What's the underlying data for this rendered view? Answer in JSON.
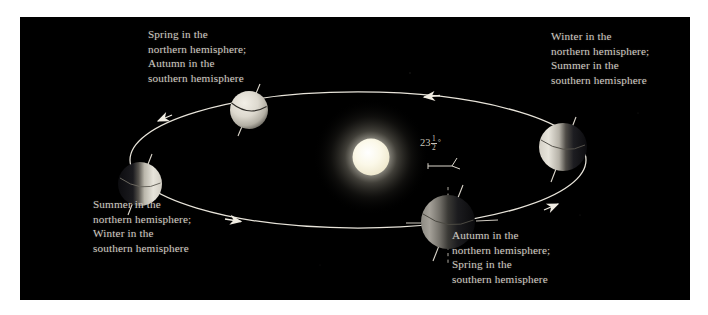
{
  "figure": {
    "background_color": "#ffffff",
    "panel_color": "#000000",
    "title": ""
  },
  "sun": {
    "name": "Sun",
    "core_color": "#fffdf2",
    "glow_color": "#c8c4b0",
    "center_x": 351,
    "center_y": 140,
    "radius": 19
  },
  "orbit": {
    "color": "#e8e4da",
    "center_x": 338,
    "center_y": 143,
    "radius_x": 228,
    "radius_y": 68,
    "direction": "counterclockwise",
    "arrow_count": 4
  },
  "axis": {
    "tilt_value": "23",
    "tilt_fraction_numerator": "1",
    "tilt_fraction_denominator": "2",
    "tilt_degree_symbol": "°",
    "tilt_full_text": "23 1/2 degrees"
  },
  "earths": [
    {
      "id": "earth-top",
      "position_name": "top",
      "center_x": 229,
      "center_y": 93,
      "radius": 19,
      "lit_side": "full",
      "axis_tilt_deg": -23.5
    },
    {
      "id": "earth-left",
      "position_name": "left",
      "center_x": 120,
      "center_y": 167,
      "radius": 22,
      "lit_side": "right",
      "axis_tilt_deg": -23.5
    },
    {
      "id": "earth-bottom",
      "position_name": "bottom",
      "center_x": 428,
      "center_y": 205,
      "radius": 27,
      "lit_side": "left",
      "axis_tilt_deg": -23.5
    },
    {
      "id": "earth-right",
      "position_name": "right",
      "center_x": 543,
      "center_y": 130,
      "radius": 24,
      "lit_side": "left",
      "axis_tilt_deg": -23.5
    }
  ],
  "captions": {
    "spring_north": {
      "name": "spring-northern-caption",
      "lines": [
        "Spring in the",
        "northern hemisphere;",
        "Autumn in the",
        "southern hemisphere"
      ]
    },
    "winter_north": {
      "name": "winter-northern-caption",
      "lines": [
        "Winter in the",
        "northern hemisphere;",
        "Summer in the",
        "southern hemisphere"
      ]
    },
    "summer_north": {
      "name": "summer-northern-caption",
      "lines": [
        "Summer in the",
        "northern hemisphere;",
        "Winter in the",
        "southern hemisphere"
      ]
    },
    "autumn_north": {
      "name": "autumn-northern-caption",
      "lines": [
        "Autumn in the",
        "northern hemisphere;",
        "Spring in the",
        "southern hemisphere"
      ]
    }
  },
  "colors": {
    "caption_text": "#cfcac2",
    "orbit_line": "#e8e4da",
    "earth_lit": "#e6e3da",
    "earth_dark": "#16161a",
    "axis_line": "#ded9ce",
    "panel_bg": "#000000",
    "page_bg": "#ffffff"
  }
}
